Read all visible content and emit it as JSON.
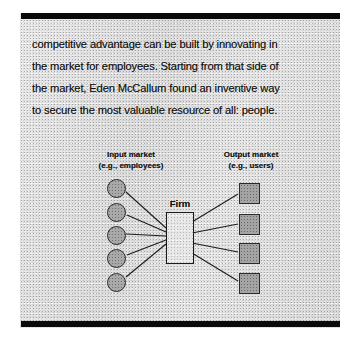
{
  "page": {
    "kind": "scanned-book-page",
    "background_color": "#e9e9e9",
    "ink_color": "#111111"
  },
  "bars": {
    "top_label": "printing-bar-top",
    "bottom_label": "printing-bar-bottom",
    "color": "#0a0a0a"
  },
  "body_text": {
    "lines": [
      "competitive advantage can be built by innovating in",
      "the market for employees. Starting from that side of",
      "the market, Eden McCallum found an inventive way",
      "to secure the most valuable resource of all: people."
    ],
    "full_text": "competitive advantage can be built by innovating in the market for employees. Starting from that side of the market, Eden McCallum found an inventive way to secure the most valuable resource of all: people."
  },
  "diagram": {
    "title_left_line1": "Input market",
    "title_left_line2": "(e.g., employees)",
    "title_right_line1": "Output market",
    "title_right_line2": "(e.g., users)",
    "center_label": "Firm",
    "input_node_count": 5,
    "output_node_count": 4,
    "node_fill_color": "#a9a9a9",
    "node_stroke_color": "#2b2b2b",
    "edge_color": "#1c1c1c",
    "input_nodes": [
      {
        "cx": 115,
        "cy": 187
      },
      {
        "cx": 115,
        "cy": 211
      },
      {
        "cx": 115,
        "cy": 234
      },
      {
        "cx": 115,
        "cy": 257
      },
      {
        "cx": 115,
        "cy": 281
      }
    ],
    "output_nodes": [
      {
        "cx": 248,
        "cy": 192
      },
      {
        "cx": 248,
        "cy": 223
      },
      {
        "cx": 248,
        "cy": 252
      },
      {
        "cx": 248,
        "cy": 282
      }
    ],
    "firm_box": {
      "x": 166,
      "y": 212,
      "w": 26,
      "h": 50
    },
    "input_edges": [
      {
        "x1": 126,
        "y1": 192,
        "x2": 166,
        "y2": 228
      },
      {
        "x1": 127,
        "y1": 215,
        "x2": 166,
        "y2": 232
      },
      {
        "x1": 126,
        "y1": 234,
        "x2": 166,
        "y2": 236
      },
      {
        "x1": 127,
        "y1": 255,
        "x2": 166,
        "y2": 240
      },
      {
        "x1": 126,
        "y1": 277,
        "x2": 166,
        "y2": 244
      }
    ],
    "output_edges": [
      {
        "x1": 192,
        "y1": 222,
        "x2": 238,
        "y2": 194
      },
      {
        "x1": 192,
        "y1": 233,
        "x2": 238,
        "y2": 224
      },
      {
        "x1": 192,
        "y1": 243,
        "x2": 238,
        "y2": 252
      },
      {
        "x1": 192,
        "y1": 253,
        "x2": 238,
        "y2": 281
      }
    ]
  }
}
